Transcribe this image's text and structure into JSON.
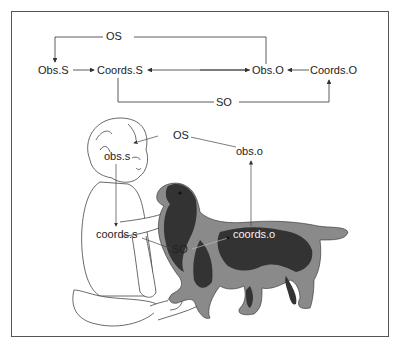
{
  "top_diagram": {
    "nodes": {
      "obs_s": "Obs.S",
      "coords_s": "Coords.S",
      "obs_o": "Obs.O",
      "coords_o": "Coords.O"
    },
    "edges": {
      "os": "OS",
      "so": "SO"
    }
  },
  "illustration": {
    "subject": "baby",
    "object": "dog",
    "labels": {
      "os": "OS",
      "obs_s": "obs.s",
      "obs_o": "obs.o",
      "coords_s": "coords.s",
      "coords_o": "coords.o",
      "so": "SO"
    }
  },
  "colors": {
    "line": "#333333",
    "frame": "#555555",
    "dog_dark": "#3a3a3a",
    "dog_light": "#8a8a8a"
  }
}
